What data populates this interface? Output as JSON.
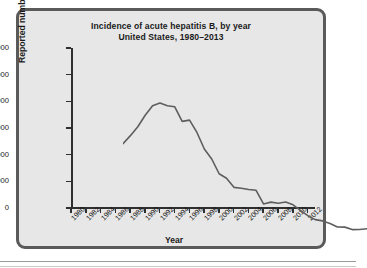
{
  "figure": {
    "title_line1": "Incidence of acute hepatitis B, by year",
    "title_line2": "United States, 1980–2013"
  },
  "chart_data": {
    "type": "line",
    "title": "Incidence of acute hepatitis B, by year\nUnited States, 1980–2013",
    "xlabel": "Year",
    "ylabel": "Reported number of cases",
    "xlim": [
      1980,
      2013
    ],
    "ylim": [
      0,
      30000
    ],
    "ytick_labels": [
      "30,000",
      "25,000",
      "20,000",
      "15,000",
      "10,000",
      "5,000",
      "0"
    ],
    "ytick_values": [
      30000,
      25000,
      20000,
      15000,
      10000,
      5000,
      0
    ],
    "xtick_labels": [
      "1980",
      "1982",
      "1984",
      "1986",
      "1988",
      "1990",
      "1992",
      "1994",
      "1996",
      "1998",
      "2000",
      "2002",
      "2004",
      "2006",
      "2008",
      "2010",
      "2012"
    ],
    "xtick_values": [
      1980,
      1982,
      1984,
      1986,
      1988,
      1990,
      1992,
      1994,
      1996,
      1998,
      2000,
      2002,
      2004,
      2006,
      2008,
      2010,
      2012
    ],
    "grid": false,
    "legend": false,
    "line_color": "#5e5e5e",
    "x": [
      1980,
      1981,
      1982,
      1983,
      1984,
      1985,
      1986,
      1987,
      1988,
      1989,
      1990,
      1991,
      1992,
      1993,
      1994,
      1995,
      1996,
      1997,
      1998,
      1999,
      2000,
      2001,
      2002,
      2003,
      2004,
      2005,
      2006,
      2007,
      2008,
      2009,
      2010,
      2011,
      2012,
      2013
    ],
    "values": [
      19015,
      20500,
      22177,
      24318,
      26115,
      26611,
      26107,
      25916,
      23177,
      23419,
      21102,
      18003,
      16126,
      13361,
      12517,
      10805,
      10637,
      10416,
      10258,
      7694,
      8036,
      7844,
      8064,
      7526,
      6479,
      5494,
      4758,
      4519,
      4033,
      3371,
      3350,
      2890,
      2895,
      3050
    ]
  },
  "axis": {
    "x_title": "Year",
    "y_title": "Reported number of cases"
  }
}
